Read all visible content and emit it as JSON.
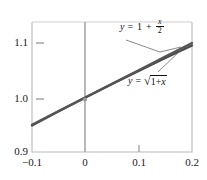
{
  "chart_data": {
    "type": "line",
    "title": "",
    "xlabel": "",
    "ylabel": "",
    "xlim": [
      -0.1,
      0.2
    ],
    "ylim": [
      0.9,
      1.15
    ],
    "grid": false,
    "legend_position": "inline-annotations",
    "x_ticks": [
      "-0.1",
      "0",
      "0.1",
      "0.2"
    ],
    "x_tick_values": [
      -0.1,
      0,
      0.1,
      0.2
    ],
    "y_ticks": [
      "0.9",
      "1.0",
      "1.1"
    ],
    "y_tick_values": [
      0.9,
      1.0,
      1.1
    ],
    "series": [
      {
        "name": "y = 1 + x/2",
        "label_text": "y = 1 + x/2",
        "color": "#555555",
        "x": [
          -0.1,
          -0.05,
          0,
          0.05,
          0.1,
          0.15,
          0.2
        ],
        "values": [
          0.95,
          0.975,
          1.0,
          1.025,
          1.05,
          1.075,
          1.1
        ]
      },
      {
        "name": "y = sqrt(1 + x)",
        "label_text": "y = √(1 + x)",
        "color": "#4a4a4a",
        "x": [
          -0.1,
          -0.05,
          0,
          0.05,
          0.1,
          0.15,
          0.2
        ],
        "values": [
          0.9487,
          0.9747,
          1.0,
          1.0247,
          1.0488,
          1.0724,
          1.0954
        ]
      }
    ],
    "annotations": [
      {
        "text": "y = 1 + x/2",
        "points_to_x": 0.18,
        "points_to_y": 1.09
      },
      {
        "text": "y = √(1 + x)",
        "points_to_x": 0.18,
        "points_to_y": 1.088
      }
    ]
  },
  "axes": {
    "y_labels": [
      "1.1",
      "1.0",
      "0.9"
    ],
    "x_labels": [
      "−0.1",
      "0",
      "0.1",
      "0.2"
    ],
    "vertical_axis_color": "#9a9a9a",
    "frame_color": "#b5b5b5"
  },
  "labels": {
    "linear": {
      "y": "y",
      "equals": "=",
      "one": "1",
      "plus": "+",
      "frac_num": "x",
      "frac_den": "2"
    },
    "radical": {
      "y": "y",
      "equals": "=",
      "sign": "√",
      "one": "1",
      "plus": "+",
      "x": "x"
    }
  }
}
